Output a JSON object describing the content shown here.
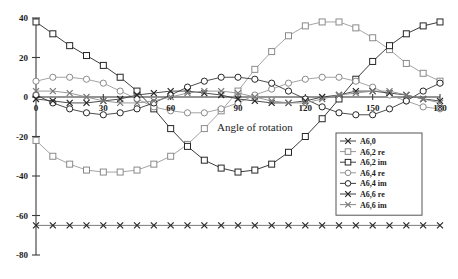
{
  "chart_data": {
    "type": "line",
    "title": "",
    "xlabel": "Angle of rotation",
    "ylabel": "",
    "xlim": [
      0,
      180
    ],
    "ylim": [
      -80,
      40
    ],
    "grid": false,
    "legend_position": "bottom-right",
    "x_ticks": [
      "0",
      "30",
      "60",
      "90",
      "120",
      "150",
      "180"
    ],
    "x_tick_values": [
      0,
      30,
      60,
      90,
      120,
      150,
      180
    ],
    "y_ticks": [
      "40",
      "20",
      "0",
      "-20",
      "-40",
      "-60",
      "-80"
    ],
    "y_tick_values": [
      40,
      20,
      0,
      -20,
      -40,
      -60,
      -80
    ],
    "x": [
      0,
      7.5,
      15,
      22.5,
      30,
      37.5,
      45,
      52.5,
      60,
      67.5,
      75,
      82.5,
      90,
      97.5,
      105,
      112.5,
      120,
      127.5,
      135,
      142.5,
      150,
      157.5,
      165,
      172.5,
      180
    ],
    "series": [
      {
        "name": "A6,0",
        "marker": "x",
        "color": "#2b2b2b",
        "line_color": "#6b6b6b",
        "values": [
          -65,
          -65,
          -65,
          -65,
          -65,
          -65,
          -65,
          -65,
          -65,
          -65,
          -65,
          -65,
          -65,
          -65,
          -65,
          -65,
          -65,
          -65,
          -65,
          -65,
          -65,
          -65,
          -65,
          -65,
          -65
        ]
      },
      {
        "name": "A6,2 re",
        "marker": "square",
        "color": "#8a8a8a",
        "line_color": "#9a9a9a",
        "values": [
          -22,
          -30,
          -34,
          -37,
          -38,
          -38,
          -37,
          -34,
          -30,
          -24,
          -16,
          -7,
          3,
          14,
          23,
          31,
          36,
          38,
          38,
          35,
          30,
          24,
          17,
          12,
          8
        ]
      },
      {
        "name": "A6,2 im",
        "marker": "square",
        "color": "#262626",
        "line_color": "#262626",
        "values": [
          38,
          32,
          26,
          21,
          16,
          10,
          3,
          -6,
          -16,
          -25,
          -32,
          -36,
          -38,
          -37,
          -34,
          -28,
          -20,
          -11,
          -1,
          9,
          18,
          26,
          32,
          36,
          38
        ]
      },
      {
        "name": "A6,4 re",
        "marker": "circle",
        "color": "#8a8a8a",
        "line_color": "#9a9a9a",
        "values": [
          8,
          10,
          10,
          9,
          7,
          3,
          -1,
          -5,
          -7,
          -8,
          -8,
          -6,
          -3,
          1,
          4,
          7,
          9,
          10,
          10,
          8,
          5,
          1,
          -2,
          -5,
          -6
        ]
      },
      {
        "name": "A6,4 im",
        "marker": "circle",
        "color": "#262626",
        "line_color": "#3a3a3a",
        "values": [
          1,
          -3,
          -6,
          -8,
          -9,
          -8,
          -6,
          -3,
          1,
          5,
          8,
          10,
          10,
          9,
          7,
          3,
          -1,
          -5,
          -8,
          -9,
          -9,
          -6,
          -2,
          3,
          7
        ]
      },
      {
        "name": "A6,6 re",
        "marker": "x",
        "color": "#262626",
        "line_color": "#3a3a3a",
        "values": [
          -1,
          -2,
          -3,
          -3,
          -2,
          -1,
          1,
          2,
          3,
          3,
          2,
          1,
          -1,
          -2,
          -3,
          -3,
          -2,
          0,
          1,
          3,
          3,
          2,
          1,
          -1,
          -2
        ]
      },
      {
        "name": "A6,6 im",
        "marker": "x",
        "color": "#787878",
        "line_color": "#8d8d8d",
        "values": [
          3,
          3,
          2,
          0,
          -2,
          -3,
          -3,
          -2,
          0,
          2,
          3,
          3,
          2,
          0,
          -2,
          -3,
          -3,
          -1,
          1,
          2,
          3,
          3,
          1,
          -1,
          -3
        ]
      }
    ],
    "legend_entries": [
      {
        "label": "A6,0",
        "marker": "x",
        "color": "#2b2b2b"
      },
      {
        "label": "A6,2 re",
        "marker": "square",
        "color": "#8a8a8a"
      },
      {
        "label": "A6,2 im",
        "marker": "square",
        "color": "#262626"
      },
      {
        "label": "A6,4 re",
        "marker": "circle",
        "color": "#8a8a8a"
      },
      {
        "label": "A6,4 im",
        "marker": "circle",
        "color": "#262626"
      },
      {
        "label": "A6,6 re",
        "marker": "x",
        "color": "#262626"
      },
      {
        "label": "A6,6 im",
        "marker": "x",
        "color": "#787878"
      }
    ]
  }
}
